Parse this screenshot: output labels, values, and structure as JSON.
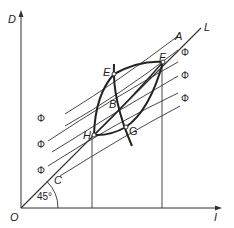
{
  "diagram": {
    "axes": {
      "y_label": "D",
      "x_label": "I",
      "origin_label": "O"
    },
    "line_label": "L",
    "angle_label": "45°",
    "points": {
      "A": "A",
      "B": "B",
      "C": "C",
      "E": "E",
      "F": "F",
      "G": "G",
      "H": "H"
    },
    "curve_label": "Φ",
    "phi_labels_left": [
      "Φ",
      "Φ",
      "Φ"
    ],
    "phi_labels_right": [
      "Φ",
      "Φ",
      "Φ"
    ],
    "colors": {
      "line": "#333333",
      "thick": "#222222",
      "text": "#222222"
    }
  }
}
